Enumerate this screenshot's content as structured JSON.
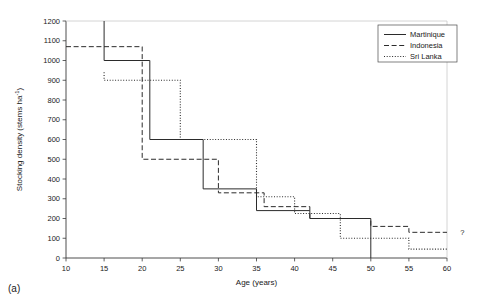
{
  "caption": "(a)",
  "chart_data": {
    "type": "line",
    "title": "",
    "xlabel": "Age (years)",
    "ylabel": "Stocking density (stems ha-1)",
    "ylabel_display": "Stocking density (stems ha",
    "ylabel_sup": "-1",
    "ylabel_tail": ")",
    "xlim": [
      10,
      60
    ],
    "ylim": [
      0,
      1200
    ],
    "xticks": [
      10,
      15,
      20,
      25,
      30,
      35,
      40,
      45,
      50,
      55,
      60
    ],
    "yticks": [
      0,
      100,
      200,
      300,
      400,
      500,
      600,
      700,
      800,
      900,
      1000,
      1100,
      1200
    ],
    "grid": false,
    "legend_position": "top-right",
    "step_style": "post",
    "annotations": [
      {
        "text": "?",
        "x": 61.2,
        "y": 130
      }
    ],
    "series": [
      {
        "name": "Martinique",
        "dash": "solid",
        "color": "#2b2b2b",
        "points": [
          {
            "x": 15,
            "y": 1200
          },
          {
            "x": 15,
            "y": 1000
          },
          {
            "x": 21,
            "y": 1000
          },
          {
            "x": 21,
            "y": 600
          },
          {
            "x": 28,
            "y": 600
          },
          {
            "x": 28,
            "y": 350
          },
          {
            "x": 35,
            "y": 350
          },
          {
            "x": 35,
            "y": 240
          },
          {
            "x": 42,
            "y": 240
          },
          {
            "x": 42,
            "y": 200
          },
          {
            "x": 50,
            "y": 200
          },
          {
            "x": 50,
            "y": 0
          }
        ]
      },
      {
        "name": "Indonesia",
        "dash": "dashed",
        "color": "#2b2b2b",
        "points": [
          {
            "x": 10,
            "y": 1070
          },
          {
            "x": 20,
            "y": 1070
          },
          {
            "x": 20,
            "y": 500
          },
          {
            "x": 30,
            "y": 500
          },
          {
            "x": 30,
            "y": 330
          },
          {
            "x": 36,
            "y": 330
          },
          {
            "x": 36,
            "y": 260
          },
          {
            "x": 42,
            "y": 260
          },
          {
            "x": 42,
            "y": 200
          },
          {
            "x": 50,
            "y": 200
          },
          {
            "x": 50,
            "y": 160
          },
          {
            "x": 55,
            "y": 160
          },
          {
            "x": 55,
            "y": 130
          },
          {
            "x": 60,
            "y": 130
          }
        ]
      },
      {
        "name": "Sri Lanka",
        "dash": "dotted",
        "color": "#2b2b2b",
        "points": [
          {
            "x": 15,
            "y": 940
          },
          {
            "x": 15,
            "y": 900
          },
          {
            "x": 25,
            "y": 900
          },
          {
            "x": 25,
            "y": 600
          },
          {
            "x": 35,
            "y": 600
          },
          {
            "x": 35,
            "y": 310
          },
          {
            "x": 40,
            "y": 310
          },
          {
            "x": 40,
            "y": 225
          },
          {
            "x": 46,
            "y": 225
          },
          {
            "x": 46,
            "y": 100
          },
          {
            "x": 55,
            "y": 100
          },
          {
            "x": 55,
            "y": 45
          },
          {
            "x": 60,
            "y": 45
          }
        ]
      }
    ]
  },
  "legend": {
    "items": [
      {
        "label": "Martinique",
        "dash": "solid"
      },
      {
        "label": "Indonesia",
        "dash": "dashed"
      },
      {
        "label": "Sri Lanka",
        "dash": "dotted"
      }
    ]
  }
}
